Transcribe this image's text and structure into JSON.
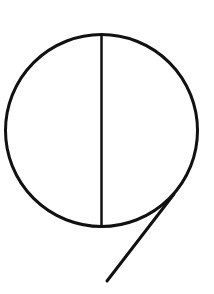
{
  "diagram": {
    "stroke_color": "#111111",
    "background_color": "#ffffff",
    "circle": {
      "cx": 101.5,
      "cy": 130.5,
      "r": 96,
      "stroke_width": 3
    },
    "diameter": {
      "x1": 101.5,
      "y1": 34,
      "x2": 101.5,
      "y2": 227,
      "stroke_width": 2.5
    },
    "tail_line": {
      "x1": 174,
      "y1": 194,
      "x2": 107,
      "y2": 281,
      "stroke_width": 3
    }
  }
}
